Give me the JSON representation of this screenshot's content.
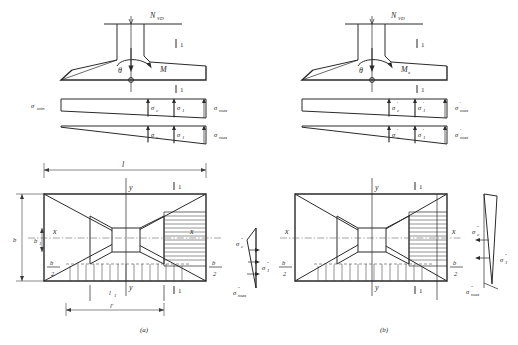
{
  "figure": {
    "captions": [
      {
        "id": "a",
        "text": "(a)"
      },
      {
        "id": "b",
        "text": "(b)"
      }
    ],
    "section_marker": "1",
    "colors": {
      "line": "#2a2a2a",
      "hatch": "#3a3a3a",
      "centerline": "#5a5a5a",
      "background": "#ffffff"
    }
  },
  "panel_a": {
    "elevation": {
      "load_label": "N",
      "load_sub": "VD",
      "moment_label": "M",
      "moment_sub": "",
      "angle_label": "θ",
      "section_label": "1"
    },
    "stress_diagram_1": {
      "left_label": "σ",
      "left_sub": "min",
      "mid_label_1": "σ",
      "mid_sub_1": "c",
      "mid_label_2": "σ",
      "mid_sub_2": "1",
      "right_label": "σ",
      "right_sub": "max",
      "section_label": "1"
    },
    "stress_diagram_2": {
      "mid_label_1": "σ",
      "mid_sub_1": "c",
      "mid_label_2": "σ",
      "mid_sub_2": "1",
      "right_label": "σ",
      "right_sub": "max"
    },
    "plan": {
      "width_label": "l",
      "height_label": "b",
      "inner_height_label": "b",
      "inner_height_sub": "1",
      "x_axis_left": "x",
      "x_axis_right": "x",
      "y_axis_top": "y",
      "y_axis_bottom": "y",
      "half_left_num": "b",
      "half_left_den": "2",
      "half_right_num": "b",
      "half_right_den": "2",
      "inner_width_label": "l",
      "inner_width_sub": "1",
      "bottom_dim_label": "l'",
      "section_label": "1"
    },
    "side_stress": {
      "top_label": "σ",
      "top_sub": "c",
      "top_prime": "″",
      "mid_label": "σ",
      "mid_sub": "1",
      "mid_prime": "″",
      "bottom_label": "σ",
      "bottom_sub": "max",
      "bottom_prime": "″"
    }
  },
  "panel_b": {
    "elevation": {
      "load_label": "N",
      "load_sub": "VD",
      "moment_label": "M",
      "moment_sub": "x",
      "angle_label": "θ",
      "section_label": "1"
    },
    "stress_diagram_1": {
      "mid_label_1": "σ",
      "mid_sub_1": "c",
      "mid_prime_1": "′",
      "mid_label_2": "σ",
      "mid_sub_2": "1",
      "mid_prime_2": "′",
      "right_label": "σ",
      "right_sub": "max",
      "right_prime": "′",
      "section_label": "1"
    },
    "stress_diagram_2": {
      "mid_label_1": "σ",
      "mid_sub_1": "c",
      "mid_prime_1": "′",
      "mid_label_2": "σ",
      "mid_sub_2": "1",
      "mid_prime_2": "′",
      "right_label": "σ",
      "right_sub": "max",
      "right_prime": "′"
    },
    "plan": {
      "x_axis_left": "x",
      "x_axis_right": "x",
      "y_axis_top": "y",
      "y_axis_bottom": "y",
      "half_left_num": "b",
      "half_left_den": "2",
      "half_right_num": "b",
      "half_right_den": "2",
      "section_label": "1"
    },
    "side_stress": {
      "top_label": "σ",
      "top_sub": "c",
      "top_prime": "″",
      "mid_label": "σ",
      "mid_sub": "1",
      "mid_prime": "″",
      "bottom_label": "σ",
      "bottom_sub": "max",
      "bottom_prime": "″"
    }
  }
}
